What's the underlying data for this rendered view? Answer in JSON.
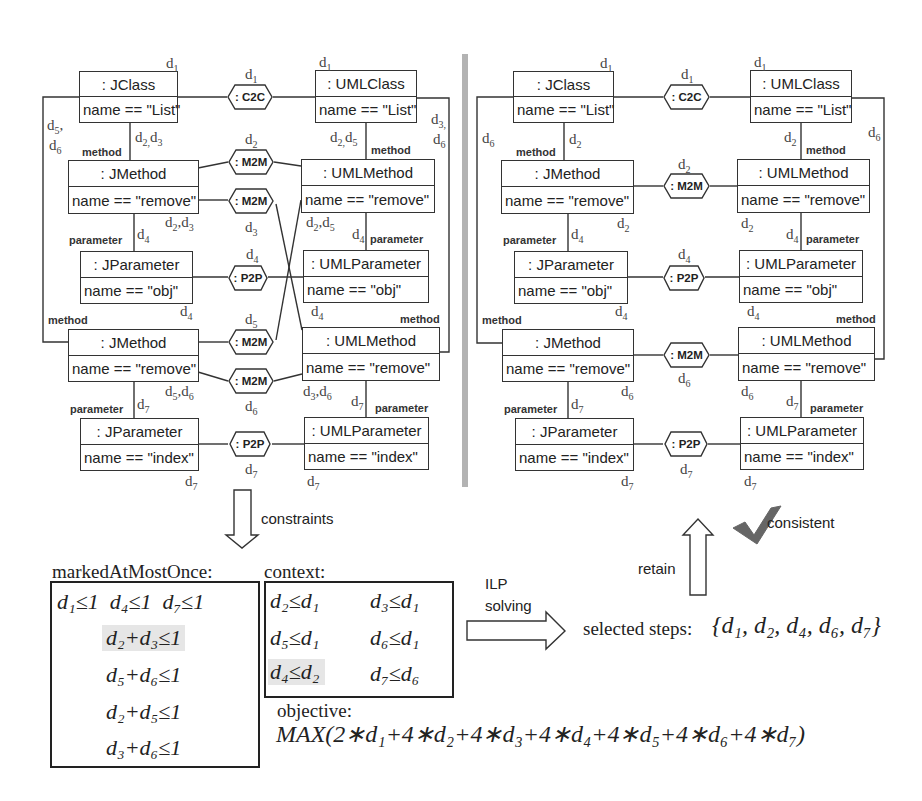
{
  "left_diagram": {
    "classes": {
      "jclass": {
        "type": ": JClass",
        "attr": "name == \"List\""
      },
      "umlclass": {
        "type": ": UMLClass",
        "attr": "name == \"List\""
      },
      "jmethod1": {
        "type": ": JMethod",
        "attr": "name == \"remove\""
      },
      "umlmethod1": {
        "type": ": UMLMethod",
        "attr": "name == \"remove\""
      },
      "jparam1": {
        "type": ": JParameter",
        "attr": "name == \"obj\""
      },
      "umlparam1": {
        "type": ": UMLParameter",
        "attr": "name == \"obj\""
      },
      "jmethod2": {
        "type": ": JMethod",
        "attr": "name == \"remove\""
      },
      "umlmethod2": {
        "type": ": UMLMethod",
        "attr": "name == \"remove\""
      },
      "jparam2": {
        "type": ": JParameter",
        "attr": "name == \"index\""
      },
      "umlparam2": {
        "type": ": UMLParameter",
        "attr": "name == \"index\""
      }
    },
    "correspondences": {
      "c2c": ": C2C",
      "m2m_a": ": M2M",
      "m2m_b": ": M2M",
      "p2p_a": ": P2P",
      "m2m_c": ": M2M",
      "m2m_d": ": M2M",
      "p2p_b": ": P2P"
    },
    "roles": {
      "method": "method",
      "parameter": "parameter"
    },
    "step_labels": {
      "d1": "d",
      "d1_sub": "1",
      "d2": "d",
      "d2_sub": "2",
      "d3": "d",
      "d3_sub": "3",
      "d4": "d",
      "d4_sub": "4",
      "d5": "d",
      "d5_sub": "5",
      "d6": "d",
      "d6_sub": "6",
      "d7": "d",
      "d7_sub": "7"
    }
  },
  "right_diagram": {
    "classes": {
      "jclass": {
        "type": ": JClass",
        "attr": "name == \"List\""
      },
      "umlclass": {
        "type": ": UMLClass",
        "attr": "name == \"List\""
      },
      "jmethod1": {
        "type": ": JMethod",
        "attr": "name == \"remove\""
      },
      "umlmethod1": {
        "type": ": UMLMethod",
        "attr": "name == \"remove\""
      },
      "jparam1": {
        "type": ": JParameter",
        "attr": "name == \"obj\""
      },
      "umlparam1": {
        "type": ": UMLParameter",
        "attr": "name == \"obj\""
      },
      "jmethod2": {
        "type": ": JMethod",
        "attr": "name == \"remove\""
      },
      "umlmethod2": {
        "type": ": UMLMethod",
        "attr": "name == \"remove\""
      },
      "jparam2": {
        "type": ": JParameter",
        "attr": "name == \"index\""
      },
      "umlparam2": {
        "type": ": UMLParameter",
        "attr": "name == \"index\""
      }
    },
    "correspondences": {
      "c2c": ": C2C",
      "m2m_a": ": M2M",
      "p2p_a": ": P2P",
      "m2m_c": ": M2M",
      "p2p_b": ": P2P"
    }
  },
  "flow": {
    "constraints_label": "constraints",
    "ilp_label_line1": "ILP",
    "ilp_label_line2": "solving",
    "retain_label": "retain",
    "consistent_label": "consistent",
    "check_color": "#666666",
    "divider_color": "#b3b3b3",
    "highlight_color": "#e6e6e6"
  },
  "ilp": {
    "marked_title": "markedAtMostOnce:",
    "marked_rows": [
      [
        "d₁≤1",
        "d₄≤1",
        "d₇≤1"
      ],
      [
        "d₂+d₃≤1"
      ],
      [
        "d₅+d₆≤1"
      ],
      [
        "d₂+d₅≤1"
      ],
      [
        "d₃+d₆≤1"
      ]
    ],
    "context_title": "context:",
    "context_rows": [
      [
        "d₂≤d₁",
        "d₃≤d₁"
      ],
      [
        "d₅≤d₁",
        "d₆≤d₁"
      ],
      [
        "d₄≤d₂",
        "d₇≤d₆"
      ]
    ],
    "objective_title": "objective:",
    "objective_expr": "MAX(2∗d₁+4∗d₂+4∗d₃+4∗d₄+4∗d₅+4∗d₆+4∗d₇)",
    "selected_label": "selected steps:",
    "selected_set": "{d₁, d₂, d₄, d₆, d₇}"
  }
}
